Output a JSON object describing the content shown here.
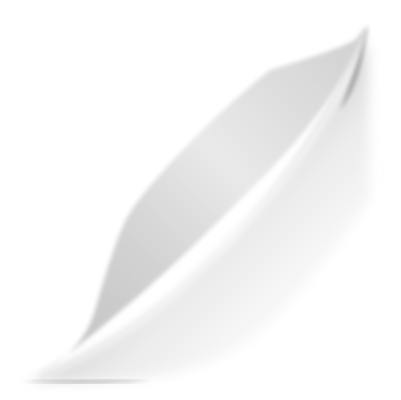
{
  "image": {
    "description": "Grayscale page-curl illustration",
    "colors": {
      "background": "#ffffff",
      "shadow_dark": "#8c8c8c",
      "shadow_mid": "#b4b4b4",
      "highlight": "#f4f4f4"
    }
  }
}
